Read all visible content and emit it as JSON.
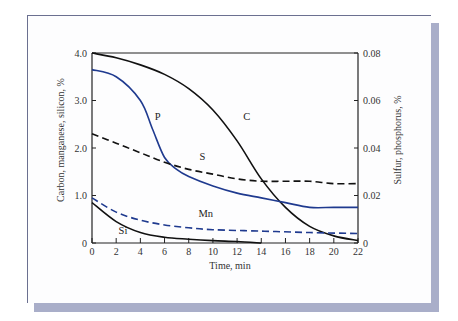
{
  "colors": {
    "black_curve": "#111111",
    "blue_curve": "#1f3a8f",
    "card_border": "#6b7090",
    "card_shadow": "#a9aec9",
    "axis": "#222222"
  },
  "chart_data": {
    "type": "line",
    "title": "",
    "xlabel": "Time, min",
    "ylabel": "Carbon, manganese, silicon, %",
    "ylabel_right": "Sulfur, phosphorus, %",
    "xlim": [
      0,
      22
    ],
    "ylim": [
      0,
      4.0
    ],
    "ylim_right": [
      0,
      0.08
    ],
    "x_ticks": [
      "0",
      "2",
      "4",
      "6",
      "8",
      "10",
      "12",
      "14",
      "16",
      "18",
      "20",
      "22"
    ],
    "y_ticks": [
      "0",
      "1.0",
      "2.0",
      "3.0",
      "4.0"
    ],
    "y_ticks_right": [
      "0",
      "0.02",
      "0.04",
      "0.06",
      "0.08"
    ],
    "grid": false,
    "legend": "inline curve labels",
    "series": [
      {
        "name": "C",
        "axis": "left",
        "style": "solid",
        "color": "#111111",
        "x": [
          0,
          2,
          4,
          6,
          8,
          10,
          12,
          14,
          16,
          18,
          20,
          22
        ],
        "values": [
          4.0,
          3.9,
          3.75,
          3.55,
          3.25,
          2.8,
          2.15,
          1.35,
          0.75,
          0.35,
          0.15,
          0.05
        ]
      },
      {
        "name": "P",
        "axis": "right",
        "style": "solid",
        "color": "#1f3a8f",
        "x": [
          0,
          2,
          4,
          5,
          6,
          7,
          8,
          10,
          12,
          14,
          16,
          18,
          20,
          22
        ],
        "values": [
          0.073,
          0.07,
          0.06,
          0.048,
          0.036,
          0.031,
          0.028,
          0.024,
          0.021,
          0.019,
          0.017,
          0.015,
          0.015,
          0.015
        ]
      },
      {
        "name": "S",
        "axis": "right",
        "style": "dashed",
        "color": "#111111",
        "x": [
          0,
          2,
          4,
          6,
          8,
          10,
          12,
          14,
          16,
          18,
          20,
          22
        ],
        "values": [
          0.046,
          0.042,
          0.038,
          0.034,
          0.031,
          0.029,
          0.027,
          0.026,
          0.026,
          0.026,
          0.025,
          0.025
        ]
      },
      {
        "name": "Mn",
        "axis": "left",
        "style": "dashed",
        "color": "#1f3a8f",
        "x": [
          0,
          2,
          4,
          6,
          8,
          10,
          14,
          18,
          22
        ],
        "values": [
          0.95,
          0.65,
          0.48,
          0.38,
          0.32,
          0.28,
          0.25,
          0.22,
          0.2
        ]
      },
      {
        "name": "Si",
        "axis": "left",
        "style": "solid",
        "color": "#111111",
        "x": [
          0,
          2,
          4,
          6,
          8,
          10,
          12,
          14
        ],
        "values": [
          0.85,
          0.45,
          0.22,
          0.12,
          0.08,
          0.05,
          0.03,
          0.0
        ]
      }
    ],
    "annotations": [
      {
        "text": "C",
        "x": 12.5,
        "y": 2.6
      },
      {
        "text": "P",
        "x": 5.2,
        "y": 2.6
      },
      {
        "text": "S",
        "x": 8.9,
        "y": 1.75
      },
      {
        "text": "Mn",
        "x": 8.8,
        "y": 0.55
      },
      {
        "text": "Si",
        "x": 2.2,
        "y": 0.2
      }
    ]
  }
}
